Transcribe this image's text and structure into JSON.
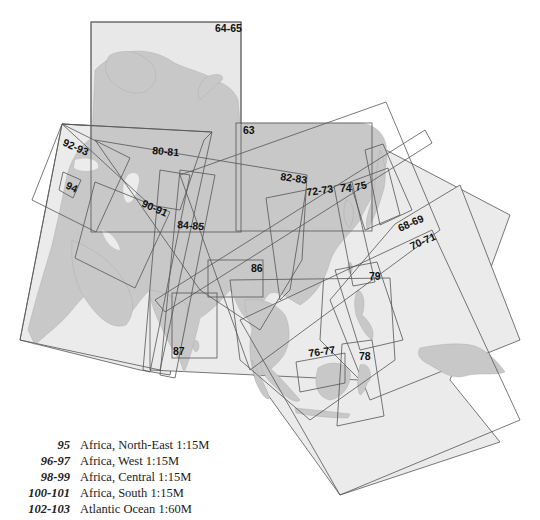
{
  "map": {
    "colors": {
      "land": "#c8c8c8",
      "sea": "#ebebeb",
      "frame": "#555555",
      "label": "#111111"
    },
    "sheet_labels": [
      {
        "id": "64-65",
        "text": "64-65"
      },
      {
        "id": "63",
        "text": "63"
      },
      {
        "id": "92-93",
        "text": "92-93"
      },
      {
        "id": "94",
        "text": "94"
      },
      {
        "id": "80-81",
        "text": "80-81"
      },
      {
        "id": "90-91",
        "text": "90-91"
      },
      {
        "id": "84-85",
        "text": "84-85"
      },
      {
        "id": "82-83",
        "text": "82-83"
      },
      {
        "id": "72-73",
        "text": "72-73"
      },
      {
        "id": "74",
        "text": "74"
      },
      {
        "id": "75",
        "text": "75"
      },
      {
        "id": "68-69",
        "text": "68-69"
      },
      {
        "id": "70-71",
        "text": "70-71"
      },
      {
        "id": "86",
        "text": "86"
      },
      {
        "id": "79",
        "text": "79"
      },
      {
        "id": "87",
        "text": "87"
      },
      {
        "id": "76-77",
        "text": "76-77"
      },
      {
        "id": "78",
        "text": "78"
      }
    ]
  },
  "legend": {
    "items": [
      {
        "pages": "95",
        "title": "Africa, North-East 1:15M"
      },
      {
        "pages": "96-97",
        "title": "Africa, West 1:15M"
      },
      {
        "pages": "98-99",
        "title": "Africa, Central 1:15M"
      },
      {
        "pages": "100-101",
        "title": "Africa, South 1:15M"
      },
      {
        "pages": "102-103",
        "title": "Atlantic Ocean 1:60M"
      }
    ]
  }
}
